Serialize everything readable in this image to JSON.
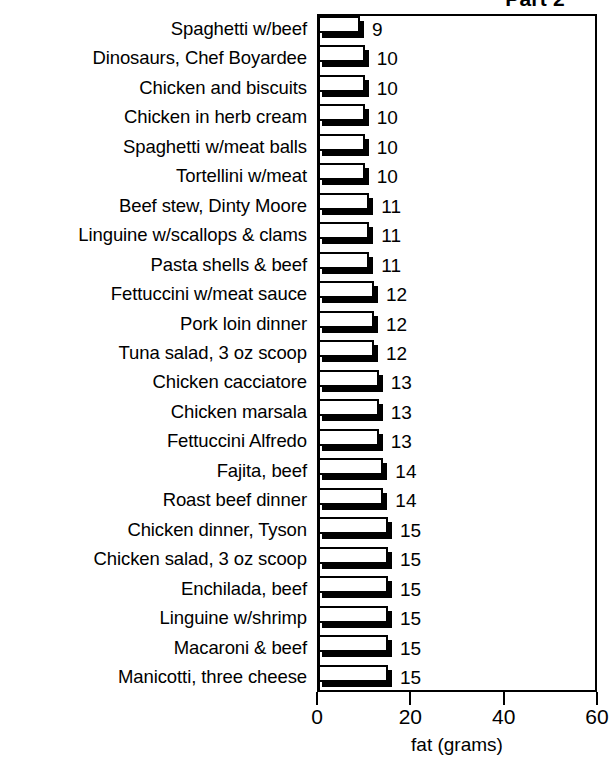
{
  "chart_data": {
    "type": "bar",
    "orientation": "horizontal",
    "title": "Part 2",
    "xlabel": "fat (grams)",
    "ylabel": "",
    "xlim": [
      0,
      60
    ],
    "xticks": [
      0,
      20,
      40,
      60
    ],
    "xtick_labels": [
      "0",
      "20",
      "40",
      "60"
    ],
    "grid": false,
    "legend": null,
    "value_labels_shown": true,
    "categories": [
      "Spaghetti w/beef",
      "Dinosaurs, Chef Boyardee",
      "Chicken and biscuits",
      "Chicken in herb cream",
      "Spaghetti w/meat balls",
      "Tortellini w/meat",
      "Beef stew, Dinty Moore",
      "Linguine w/scallops & clams",
      "Pasta shells & beef",
      "Fettuccini w/meat sauce",
      "Pork loin dinner",
      "Tuna salad, 3 oz scoop",
      "Chicken cacciatore",
      "Chicken marsala",
      "Fettuccini Alfredo",
      "Fajita, beef",
      "Roast beef dinner",
      "Chicken dinner, Tyson",
      "Chicken salad, 3 oz scoop",
      "Enchilada, beef",
      "Linguine w/shrimp",
      "Macaroni & beef",
      "Manicotti, three cheese"
    ],
    "values": [
      9,
      10,
      10,
      10,
      10,
      10,
      11,
      11,
      11,
      12,
      12,
      12,
      13,
      13,
      13,
      14,
      14,
      15,
      15,
      15,
      15,
      15,
      15
    ],
    "value_label_texts": [
      "9",
      "10",
      "10",
      "10",
      "10",
      "10",
      "11",
      "11",
      "11",
      "12",
      "12",
      "12",
      "13",
      "13",
      "13",
      "14",
      "14",
      "15",
      "15",
      "15",
      "15",
      "15",
      "15"
    ],
    "colors": {
      "bar_face": "#ffffff",
      "bar_outline": "#000000",
      "bar_shadow": "#000000",
      "axis": "#000000",
      "text": "#000000",
      "background": "#ffffff"
    }
  }
}
